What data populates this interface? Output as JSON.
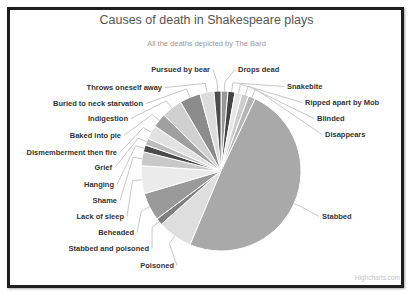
{
  "chart_data": {
    "type": "pie",
    "title": "Causes of death in Shakespeare plays",
    "subtitle": "All the deaths depicted by The Bard",
    "credit": "Highcharts.com",
    "start_angle_deg": 0,
    "direction": "clockwise",
    "categories": [
      "Drops dead",
      "Snakebite",
      "Ripped apart by Mob",
      "Blinded",
      "Disappears",
      "Stabbed",
      "Poisoned",
      "Stabbed and poisoned",
      "Beheaded",
      "Lack of sleep",
      "Shame",
      "Hanging",
      "Grief",
      "Dismemberment then fire",
      "Baked into pie",
      "Indigestion",
      "Buried to neck starvation",
      "Throws oneself away",
      "Pursued by bear"
    ],
    "values": [
      1,
      1,
      1,
      1,
      1,
      35,
      5,
      1,
      4,
      4,
      2,
      1,
      1,
      2,
      2,
      3,
      3,
      2,
      1
    ],
    "colors": [
      "#999999",
      "#444444",
      "#e6e6e6",
      "#cccccc",
      "#b5b5b5",
      "#a9a9a9",
      "#dedede",
      "#808080",
      "#9a9a9a",
      "#ebebeb",
      "#c8c8c8",
      "#4a4a4a",
      "#bdbdbd",
      "#e2e2e2",
      "#a0a0a0",
      "#d0d0d0",
      "#8c8c8c",
      "#dcdcdc",
      "#4d4d4d"
    ],
    "legend": "none (data labels with connectors)"
  }
}
